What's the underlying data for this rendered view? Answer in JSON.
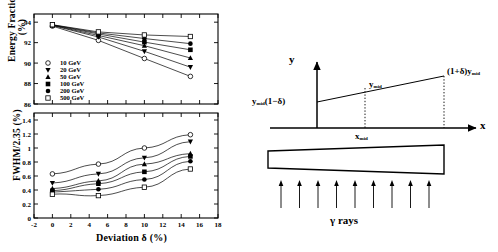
{
  "figure": {
    "panels": [
      "energy-fraction-vs-deviation",
      "fwhm-vs-deviation",
      "wedge-geometry-diagram"
    ]
  },
  "chart_data": [
    {
      "type": "line",
      "id": "top",
      "title": "",
      "xlabel": "",
      "ylabel": "Energy Fraction (%)",
      "xlim": [
        -2,
        18
      ],
      "ylim": [
        86,
        94.8
      ],
      "xticks": [
        -2,
        0,
        2,
        4,
        6,
        8,
        10,
        12,
        14,
        16,
        18
      ],
      "xticklabels": [
        "",
        "",
        "",
        "",
        "",
        "",
        "",
        "",
        "",
        "",
        ""
      ],
      "yticks": [
        86,
        88,
        90,
        92,
        94
      ],
      "yticklabels": [
        "86",
        "88",
        "90",
        "92",
        "94"
      ],
      "grid": false,
      "legend_position": "lower-left",
      "x": [
        0,
        5,
        10,
        15
      ],
      "series": [
        {
          "name": "10 GeV",
          "marker": "open-circle",
          "values": [
            93.62,
            92.22,
            90.45,
            88.7
          ]
        },
        {
          "name": "20 GeV",
          "marker": "filled-triangle-down",
          "values": [
            93.68,
            92.55,
            91.15,
            89.6
          ]
        },
        {
          "name": "50 GeV",
          "marker": "filled-triangle-up",
          "values": [
            93.7,
            92.7,
            91.7,
            90.5
          ]
        },
        {
          "name": "100 GeV",
          "marker": "filled-square",
          "values": [
            93.72,
            92.85,
            92.05,
            91.3
          ]
        },
        {
          "name": "200 GeV",
          "marker": "filled-circle",
          "values": [
            93.74,
            92.95,
            92.4,
            91.9
          ]
        },
        {
          "name": "500 GeV",
          "marker": "open-square",
          "values": [
            93.75,
            93.05,
            92.75,
            92.6
          ]
        }
      ]
    },
    {
      "type": "line",
      "id": "bottom",
      "title": "",
      "xlabel": "Deviation δ (%)",
      "ylabel": "FWHM/2.35 (%)",
      "xlim": [
        -2,
        18
      ],
      "ylim": [
        0,
        1.5
      ],
      "xticks": [
        -2,
        0,
        2,
        4,
        6,
        8,
        10,
        12,
        14,
        16,
        18
      ],
      "xticklabels": [
        "-2",
        "0",
        "2",
        "4",
        "6",
        "8",
        "10",
        "12",
        "14",
        "16",
        "18"
      ],
      "yticks": [
        0,
        0.2,
        0.4,
        0.6,
        0.8,
        1,
        1.2,
        1.4
      ],
      "yticklabels": [
        "0",
        "0.2",
        "0.4",
        "0.6",
        "0.8",
        "1",
        "1.2",
        "1.4"
      ],
      "grid": false,
      "legend_position": "none",
      "x": [
        0,
        5,
        10,
        15
      ],
      "series": [
        {
          "name": "10 GeV",
          "marker": "open-circle",
          "values": [
            0.63,
            0.77,
            1.0,
            1.19
          ]
        },
        {
          "name": "20 GeV",
          "marker": "filled-triangle-down",
          "values": [
            0.5,
            0.63,
            0.86,
            1.09
          ]
        },
        {
          "name": "50 GeV",
          "marker": "filled-triangle-up",
          "values": [
            0.42,
            0.53,
            0.77,
            0.92
          ]
        },
        {
          "name": "100 GeV",
          "marker": "filled-square",
          "values": [
            0.39,
            0.49,
            0.66,
            0.88
          ]
        },
        {
          "name": "200 GeV",
          "marker": "filled-circle",
          "values": [
            0.37,
            0.41,
            0.55,
            0.81
          ]
        },
        {
          "name": "500 GeV",
          "marker": "open-square",
          "values": [
            0.34,
            0.32,
            0.44,
            0.7
          ]
        }
      ]
    }
  ],
  "legend": {
    "items": [
      {
        "marker": "open-circle",
        "label": "10 GeV"
      },
      {
        "marker": "filled-triangle-down",
        "label": "20 GeV"
      },
      {
        "marker": "filled-triangle-up",
        "label": "50 GeV"
      },
      {
        "marker": "filled-square",
        "label": "100 GeV"
      },
      {
        "marker": "filled-circle",
        "label": "200 GeV"
      },
      {
        "marker": "open-square",
        "label": "500 GeV"
      }
    ]
  },
  "diagram": {
    "axis_y_label": "y",
    "axis_x_label": "x",
    "label_left": "y",
    "label_left_sub": "mid",
    "label_left_tail": "(1−δ)",
    "label_mid": "y",
    "label_mid_sub": "mid",
    "label_right": "(1+δ)y",
    "label_right_sub": "mid",
    "label_xmid": "x",
    "label_xmid_sub": "mid",
    "rays_label": "γ rays",
    "ray_count": 9
  },
  "colors": {
    "ink": "#000000",
    "background": "#ffffff"
  }
}
